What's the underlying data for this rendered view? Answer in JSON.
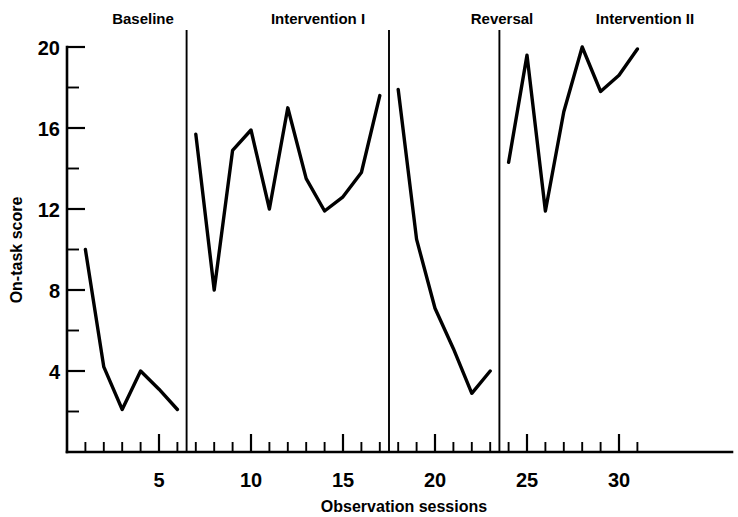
{
  "chart_data": {
    "type": "line",
    "title": "",
    "xlabel": "Observation sessions",
    "ylabel": "On-task score",
    "xlim": [
      0,
      32
    ],
    "ylim": [
      0,
      20
    ],
    "grid": false,
    "legend_position": "none",
    "x_tick_labels": [
      "5",
      "10",
      "15",
      "20",
      "25",
      "30"
    ],
    "x_tick_values": [
      5,
      10,
      15,
      20,
      25,
      30
    ],
    "y_tick_labels": [
      "4",
      "8",
      "12",
      "16",
      "20"
    ],
    "y_tick_values": [
      4,
      8,
      12,
      16,
      20
    ],
    "y_minor_ticks": [
      2,
      6,
      10,
      14,
      18
    ],
    "phase_dividers": [
      6.5,
      17.5,
      23.5
    ],
    "phases": [
      {
        "name": "Baseline",
        "x_range": [
          1,
          6
        ],
        "x": [
          1,
          2,
          3,
          4,
          5,
          6
        ],
        "values": [
          10,
          4.2,
          2.1,
          4,
          3.1,
          2.1
        ]
      },
      {
        "name": "Intervention I",
        "x_range": [
          7,
          17
        ],
        "x": [
          7,
          8,
          9,
          10,
          11,
          12,
          13,
          14,
          15,
          16,
          17
        ],
        "values": [
          15.7,
          8,
          14.9,
          15.9,
          12,
          17,
          13.5,
          11.9,
          12.6,
          13.8,
          17.6
        ]
      },
      {
        "name": "Reversal",
        "x_range": [
          18,
          23
        ],
        "x": [
          18,
          19,
          20,
          21,
          22,
          23
        ],
        "values": [
          17.9,
          10.5,
          7.1,
          5.1,
          2.9,
          4
        ]
      },
      {
        "name": "Intervention II",
        "x_range": [
          24,
          31
        ],
        "x": [
          24,
          25,
          26,
          27,
          28,
          29,
          30,
          31
        ],
        "values": [
          14.3,
          19.6,
          11.9,
          16.8,
          20,
          17.8,
          18.6,
          19.9
        ]
      }
    ],
    "series": [
      {
        "name": "On-task score",
        "x": [
          1,
          2,
          3,
          4,
          5,
          6,
          7,
          8,
          9,
          10,
          11,
          12,
          13,
          14,
          15,
          16,
          17,
          18,
          19,
          20,
          21,
          22,
          23,
          24,
          25,
          26,
          27,
          28,
          29,
          30,
          31
        ],
        "values": [
          10,
          4.2,
          2.1,
          4,
          3.1,
          2.1,
          15.7,
          8,
          14.9,
          15.9,
          12,
          17,
          13.5,
          11.9,
          12.6,
          13.8,
          17.6,
          17.9,
          10.5,
          7.1,
          5.1,
          2.9,
          4,
          14.3,
          19.6,
          11.9,
          16.8,
          20,
          17.8,
          18.6,
          19.9
        ]
      }
    ]
  },
  "labels": {
    "phase_baseline": "Baseline",
    "phase_intervention_1": "Intervention I",
    "phase_reversal": "Reversal",
    "phase_intervention_2": "Intervention II",
    "y_axis_title": "On-task score",
    "x_axis_title": "Observation sessions",
    "y_20": "20",
    "y_16": "16",
    "y_12": "12",
    "y_8": "8",
    "y_4": "4",
    "x_5": "5",
    "x_10": "10",
    "x_15": "15",
    "x_20": "20",
    "x_25": "25",
    "x_30": "30"
  },
  "colors": {
    "line": "#000000",
    "axis": "#000000",
    "background": "#ffffff"
  }
}
